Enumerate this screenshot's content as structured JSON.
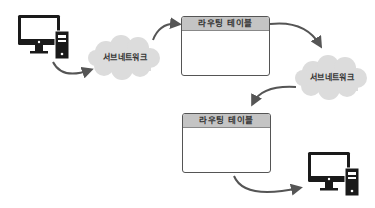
{
  "diagram": {
    "title": "",
    "nodes": [
      {
        "id": "pc-source",
        "type": "computer"
      },
      {
        "id": "subnet-1",
        "type": "cloud",
        "label": "서브네트워크"
      },
      {
        "id": "router-1",
        "type": "table",
        "label": "라우팅 테이블"
      },
      {
        "id": "subnet-2",
        "type": "cloud",
        "label": "서브네트워크"
      },
      {
        "id": "router-2",
        "type": "table",
        "label": "라우팅 테이블"
      },
      {
        "id": "pc-destination",
        "type": "computer"
      }
    ],
    "edges": [
      {
        "from": "pc-source",
        "to": "subnet-1"
      },
      {
        "from": "subnet-1",
        "to": "router-1"
      },
      {
        "from": "router-1",
        "to": "subnet-2"
      },
      {
        "from": "subnet-2",
        "to": "router-2"
      },
      {
        "from": "router-2",
        "to": "pc-destination"
      }
    ]
  },
  "labels": {
    "subnet_1": "서브네트워크",
    "subnet_2": "서브네트워크",
    "table_1": "라우팅 테이블",
    "table_2": "라우팅 테이블"
  },
  "colors": {
    "cloud": "#dcdcdc",
    "table_header": "#c4c4c4",
    "arrow": "#555555",
    "computer": "#1a1a1a"
  }
}
